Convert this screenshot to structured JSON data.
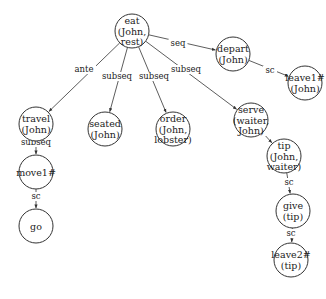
{
  "diagram": {
    "type": "directed-graph",
    "nodes": [
      {
        "id": "eat",
        "lines": [
          "eat",
          "(John,",
          "rest)"
        ],
        "x": 132,
        "y": 31
      },
      {
        "id": "depart",
        "lines": [
          "depart",
          "(John)"
        ],
        "x": 233,
        "y": 54
      },
      {
        "id": "leave1",
        "lines": [
          "leave1#",
          "(John)"
        ],
        "x": 305,
        "y": 83
      },
      {
        "id": "travel",
        "lines": [
          "travel",
          "(John)"
        ],
        "x": 36,
        "y": 124
      },
      {
        "id": "seated",
        "lines": [
          "seated",
          "(John)"
        ],
        "x": 105,
        "y": 129
      },
      {
        "id": "order",
        "lines": [
          "order",
          "(John,",
          "lobster)"
        ],
        "x": 173,
        "y": 129
      },
      {
        "id": "serve",
        "lines": [
          "serve",
          "(waiter,",
          "John)"
        ],
        "x": 251,
        "y": 120
      },
      {
        "id": "tip",
        "lines": [
          "tip",
          "(John,",
          "waiter)"
        ],
        "x": 284,
        "y": 156
      },
      {
        "id": "give",
        "lines": [
          "give",
          "(tip)"
        ],
        "x": 293,
        "y": 211
      },
      {
        "id": "leave2",
        "lines": [
          "leave2#",
          "(tip)"
        ],
        "x": 291,
        "y": 260
      },
      {
        "id": "move1",
        "lines": [
          "move1#"
        ],
        "x": 36,
        "y": 172
      },
      {
        "id": "go",
        "lines": [
          "go"
        ],
        "x": 36,
        "y": 226
      }
    ],
    "edges": [
      {
        "from": "eat",
        "to": "depart",
        "label": "seq",
        "lx": 178,
        "ly": 46
      },
      {
        "from": "depart",
        "to": "leave1",
        "label": "sc",
        "lx": 270,
        "ly": 73
      },
      {
        "from": "eat",
        "to": "travel",
        "label": "ante",
        "lx": 84,
        "ly": 72
      },
      {
        "from": "eat",
        "to": "seated",
        "label": "subseq",
        "lx": 117,
        "ly": 79
      },
      {
        "from": "eat",
        "to": "order",
        "label": "subseq",
        "lx": 154,
        "ly": 79
      },
      {
        "from": "eat",
        "to": "serve",
        "label": "subseq",
        "lx": 186,
        "ly": 72
      },
      {
        "from": "serve",
        "to": "tip",
        "label": "sc",
        "lx": 259,
        "ly": 134
      },
      {
        "from": "tip",
        "to": "give",
        "label": "sc",
        "lx": 289,
        "ly": 185
      },
      {
        "from": "give",
        "to": "leave2",
        "label": "sc",
        "lx": 291,
        "ly": 236
      },
      {
        "from": "travel",
        "to": "move1",
        "label": "subseq",
        "lx": 36,
        "ly": 145
      },
      {
        "from": "move1",
        "to": "go",
        "label": "sc",
        "lx": 36,
        "ly": 199
      }
    ],
    "node_radius": 17
  }
}
